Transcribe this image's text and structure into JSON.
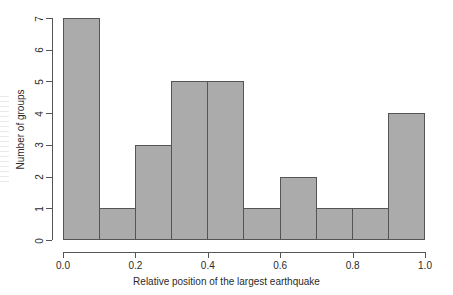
{
  "chart_data": {
    "type": "bar",
    "title": "",
    "subtitle": "",
    "xlabel": "Relative position of the largest earthquake",
    "ylabel": "Number of groups",
    "categories": [
      "0.0-0.1",
      "0.1-0.2",
      "0.2-0.3",
      "0.3-0.4",
      "0.4-0.5",
      "0.5-0.6",
      "0.6-0.7",
      "0.7-0.8",
      "0.8-0.9",
      "0.9-1.0"
    ],
    "bin_edges": [
      0.0,
      0.1,
      0.2,
      0.3,
      0.4,
      0.5,
      0.6,
      0.7,
      0.8,
      0.9,
      1.0
    ],
    "bin_width": 0.1,
    "values": [
      7,
      1,
      3,
      5,
      5,
      1,
      2,
      1,
      1,
      4
    ],
    "total_count": 30,
    "xlim": [
      0.0,
      1.0
    ],
    "ylim": [
      0,
      7
    ],
    "x_tick_labels": [
      "0.0",
      "0.2",
      "0.4",
      "0.6",
      "0.8",
      "1.0"
    ],
    "x_tick_values": [
      0.0,
      0.2,
      0.4,
      0.6,
      0.8,
      1.0
    ],
    "y_tick_labels": [
      "0",
      "1",
      "2",
      "3",
      "4",
      "5",
      "6",
      "7"
    ],
    "y_tick_values": [
      0,
      1,
      2,
      3,
      4,
      5,
      6,
      7
    ],
    "grid": false,
    "legend": false,
    "legend_position": "none",
    "annotations": [],
    "style": {
      "bar_fill": "#ababab",
      "bar_border": "#555555",
      "axis_color": "#555555",
      "text_color": "#2b2b2b",
      "background": "#ffffff"
    }
  }
}
